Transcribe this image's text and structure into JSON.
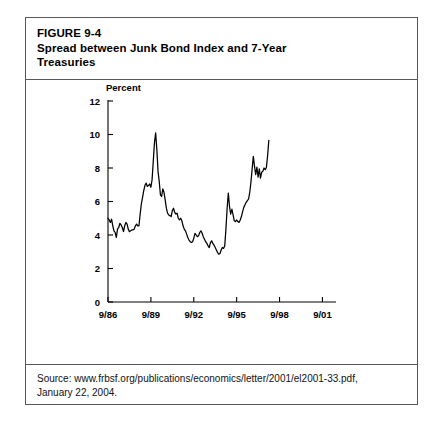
{
  "figure": {
    "title_lines": [
      "FIGURE 9-4",
      "Spread between Junk Bond Index and 7-Year",
      "Treasuries"
    ],
    "source_lines": [
      "Source: www.frbsf.org/publications/economics/letter/2001/el2001-33.pdf,",
      "January 22, 2004."
    ],
    "border_color": "#55585c"
  },
  "chart_data": {
    "type": "line",
    "title": "Spread between Junk Bond Index and 7-Year Treasuries",
    "xlabel": "",
    "ylabel": "Percent",
    "ylim": [
      0,
      12
    ],
    "yticks": [
      0,
      2,
      4,
      6,
      8,
      10,
      12
    ],
    "ytick_labels": [
      "0",
      "2",
      "4",
      "6",
      "8",
      "10",
      "12"
    ],
    "xtick_labels": [
      "9/86",
      "9/89",
      "9/92",
      "9/95",
      "9/98",
      "9/01"
    ],
    "xtick_positions": [
      0,
      36,
      72,
      108,
      144,
      180
    ],
    "xlim": [
      0,
      183
    ],
    "grid": false,
    "legend": "none",
    "line_color": "#000000",
    "series": [
      {
        "name": "Junk bond spread over 7-year Treasuries",
        "x_unit": "months since 9/1986",
        "values": [
          5.0,
          4.9,
          4.75,
          4.95,
          4.55,
          4.25,
          4.15,
          3.85,
          4.35,
          4.45,
          4.7,
          4.6,
          4.45,
          4.2,
          4.55,
          4.75,
          4.65,
          4.35,
          4.2,
          4.25,
          4.3,
          4.3,
          4.35,
          4.55,
          4.65,
          4.55,
          4.55,
          5.25,
          5.85,
          6.25,
          6.65,
          6.95,
          7.1,
          6.9,
          6.95,
          7.05,
          6.85,
          7.3,
          8.4,
          9.5,
          10.1,
          9.1,
          7.8,
          7.2,
          6.4,
          6.3,
          6.75,
          6.55,
          6.1,
          5.6,
          5.3,
          5.2,
          5.15,
          5.1,
          5.45,
          5.6,
          5.35,
          5.25,
          5.3,
          5.0,
          4.9,
          5.0,
          4.85,
          4.55,
          4.35,
          4.25,
          4.05,
          3.85,
          3.7,
          3.6,
          3.55,
          3.6,
          3.8,
          4.1,
          4.0,
          3.9,
          3.95,
          4.15,
          4.25,
          4.1,
          3.9,
          3.75,
          3.6,
          3.5,
          3.35,
          3.25,
          3.55,
          3.65,
          3.5,
          3.4,
          3.25,
          3.1,
          2.95,
          2.85,
          2.9,
          3.1,
          3.25,
          3.2,
          3.35,
          4.35,
          5.6,
          6.5,
          5.7,
          5.25,
          5.55,
          5.2,
          4.85,
          4.8,
          4.9,
          4.8,
          4.75,
          4.9,
          5.1,
          5.4,
          5.65,
          5.8,
          5.95,
          6.05,
          6.15,
          6.55,
          7.15,
          7.95,
          8.7,
          8.1,
          7.6,
          8.05,
          7.45,
          7.95,
          7.4,
          7.75,
          7.8,
          8.0,
          7.9,
          8.05,
          8.75,
          9.65
        ]
      }
    ]
  }
}
